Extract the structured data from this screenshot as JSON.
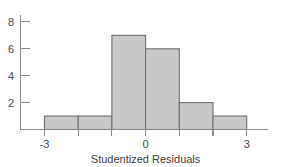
{
  "chart_data": {
    "type": "bar",
    "title": "",
    "subtitle": "",
    "xlabel": "Studentized Residuals",
    "ylabel": "",
    "xlim": [
      -3.6,
      3.6
    ],
    "ylim": [
      0,
      8.9
    ],
    "grid": false,
    "legend": null,
    "bin_width": 1,
    "bin_edges": [
      -3,
      -2,
      -1,
      0,
      1,
      2,
      3
    ],
    "categories": [
      "-3 to -2",
      "-2 to -1",
      "-1 to 0",
      "0 to 1",
      "1 to 2",
      "2 to 3"
    ],
    "values": [
      1,
      1,
      7,
      6,
      2,
      1
    ],
    "bar_centers": [
      -2.5,
      -1.5,
      -0.5,
      0.5,
      1.5,
      2.5
    ],
    "x_ticks": [
      -3,
      -2,
      -1,
      0,
      1,
      2,
      3
    ],
    "x_tick_labels": [
      "-3",
      "",
      "",
      "0",
      "",
      "",
      "3"
    ],
    "x_major_labeled": [
      "-3",
      "0",
      "3"
    ],
    "y_ticks": [
      2,
      4,
      6,
      8
    ],
    "y_tick_labels": [
      "2",
      "4",
      "6",
      "8"
    ],
    "colors": {
      "bar_fill": "#c9c9c9",
      "bar_stroke": "#707070",
      "axis": "#8a8a8a",
      "text": "#4a4a4a",
      "background": "#ffffff"
    }
  },
  "axis": {
    "x_title": "Studentized Residuals",
    "y_labels": {
      "t2": "2",
      "t4": "4",
      "t6": "6",
      "t8": "8"
    },
    "x_labels": {
      "neg3": "-3",
      "zero": "0",
      "pos3": "3"
    }
  }
}
